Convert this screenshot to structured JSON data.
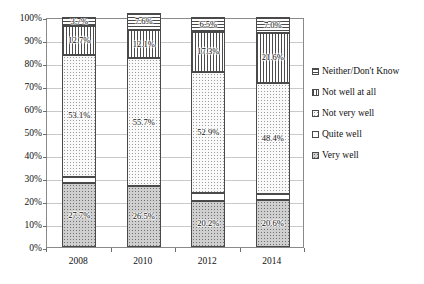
{
  "chart_data": {
    "type": "bar",
    "subtype": "100% stacked column",
    "title": "",
    "subtitle": "",
    "xlabel": "",
    "ylabel": "",
    "categories": [
      "2008",
      "2010",
      "2012",
      "2014"
    ],
    "ylim": [
      0,
      100
    ],
    "y_tick_labels": [
      "0%",
      "10%",
      "20%",
      "30%",
      "40%",
      "50%",
      "60%",
      "70%",
      "80%",
      "90%",
      "100%"
    ],
    "y_tick_values": [
      0,
      10,
      20,
      30,
      40,
      50,
      60,
      70,
      80,
      90,
      100
    ],
    "grid": true,
    "legend_position": "right",
    "series": [
      {
        "name": "Very well",
        "pattern": "gray-dots",
        "values": [
          27.7,
          26.5,
          20.2,
          20.6
        ],
        "labels": [
          "27.7%",
          "26.5%",
          "20.2%",
          "20.6%"
        ]
      },
      {
        "name": "Quite well",
        "pattern": "white",
        "values": [
          2.8,
          0.0,
          3.1,
          2.4
        ],
        "labels": [
          "",
          "",
          "",
          ""
        ]
      },
      {
        "name": "Not very well",
        "pattern": "light-dots",
        "values": [
          53.1,
          55.7,
          52.9,
          48.4
        ],
        "labels": [
          "53.1%",
          "55.7%",
          "52.9%",
          "48.4%"
        ]
      },
      {
        "name": "Not well at all",
        "pattern": "vertical-lines",
        "values": [
          12.7,
          12.1,
          17.3,
          21.6
        ],
        "labels": [
          "12.7%",
          "12.1%",
          "17.3%",
          "21.6%"
        ]
      },
      {
        "name": "Neither/Don't Know",
        "pattern": "horizontal-lines",
        "values": [
          3.7,
          7.6,
          6.5,
          7.0
        ],
        "labels": [
          "3.7%",
          "7.6%",
          "6.5%",
          "7.0%"
        ]
      }
    ],
    "legend_entries": [
      "Neither/Don't Know",
      "Not well at all",
      "Not very well",
      "Quite well",
      "Very well"
    ]
  },
  "colors": {
    "axis": "#8a8a8a",
    "gridline": "#c9c9c9",
    "bar_outline": "#4a4a4a",
    "text": "#111111",
    "background": "#ffffff"
  }
}
